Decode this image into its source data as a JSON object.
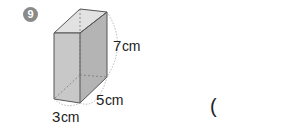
{
  "problem": {
    "number": "9",
    "badge_color": "#8a8a8a"
  },
  "figure": {
    "type": "rectangular prism",
    "dimensions": [
      {
        "name": "height",
        "value": "7",
        "unit": "cm"
      },
      {
        "name": "depth",
        "value": "5",
        "unit": "cm"
      },
      {
        "name": "width",
        "value": "3",
        "unit": "cm"
      }
    ],
    "colors": {
      "front_face": "#c8c8c8",
      "side_face": "#b4b4b4",
      "top_face": "#e2e2e2",
      "edge": "#555555",
      "hidden_edge": "#777777"
    }
  },
  "answer": {
    "open_paren": "("
  }
}
